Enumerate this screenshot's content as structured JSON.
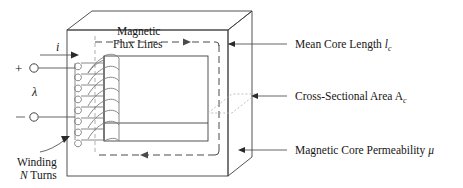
{
  "figure": {
    "labels": {
      "flux_line1": "Magnetic",
      "flux_line2": "Flux Lines",
      "mean_core_length": "Mean Core Length ",
      "mean_core_length_sym": "l",
      "mean_core_length_sub": "c",
      "cross_sectional_area": "Cross-Sectional Area A",
      "cross_sectional_area_sub": "c",
      "core_permeability": "Magnetic Core Permeability ",
      "core_permeability_sym": "μ",
      "winding_line1": "Winding",
      "winding_line2_sym": "N",
      "winding_line2_rest": " Turns",
      "current_sym": "i",
      "flux_linkage_sym": "λ",
      "plus_sign": "+",
      "minus_sign": "–"
    },
    "colors": {
      "background": "#ffffff",
      "outline": "#3f3f3f",
      "flux_dash": "#4a4a4a",
      "hidden_dash": "#9a9a9a",
      "coil": "#7a7a7a",
      "text": "#161616"
    }
  }
}
